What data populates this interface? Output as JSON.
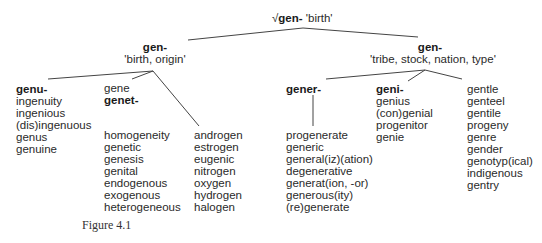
{
  "root": {
    "symbol": "√",
    "morpheme": "gen-",
    "gloss": "'birth'"
  },
  "branches": [
    {
      "morpheme": "gen-",
      "gloss": "'birth, origin'",
      "groups": [
        {
          "head": "genu-",
          "words": [
            "ingenuity",
            "ingenious",
            "(dis)ingenuous",
            "genus",
            "genuine"
          ]
        },
        {
          "pre": "gene",
          "head": "genet-",
          "words": [
            "homogeneity",
            "genetic",
            "genesis",
            "genital",
            "endogenous",
            "exogenous",
            "heterogeneous"
          ]
        },
        {
          "words": [
            "androgen",
            "estrogen",
            "eugenic",
            "nitrogen",
            "oxygen",
            "hydrogen",
            "halogen"
          ]
        }
      ]
    },
    {
      "morpheme": "gen-",
      "gloss": "'tribe, stock, nation, type'",
      "groups": [
        {
          "head": "gener-",
          "words": [
            "progenerate",
            "generic",
            "general(iz)(ation)",
            "degenerative",
            "generat(ion, -or)",
            "generous(ity)",
            "(re)generate"
          ]
        },
        {
          "head": "geni-",
          "words": [
            "genius",
            "(con)genial",
            "progenitor",
            "genie"
          ]
        },
        {
          "words": [
            "gentle",
            "genteel",
            "gentile",
            "progeny",
            "genre",
            "gender",
            "genotyp(ical)",
            "indigenous",
            "gentry"
          ]
        }
      ]
    }
  ],
  "caption": "Figure 4.1"
}
